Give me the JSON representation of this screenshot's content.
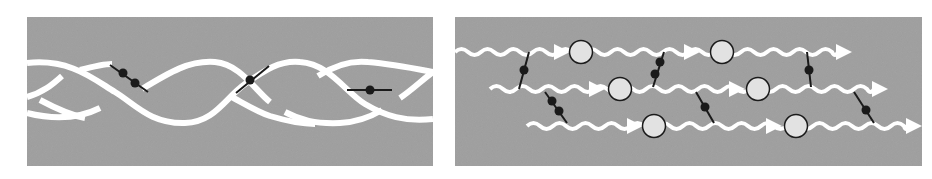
{
  "figure": {
    "panels": [
      {
        "id": "left",
        "description": "double-helix strands with cross-linking molecules",
        "bounds": {
          "x": 27,
          "y": 17,
          "w": 406,
          "h": 149
        },
        "linkers": [
          {
            "x1": 110,
            "y1": 65,
            "x2": 148,
            "y2": 92,
            "dots": [
              [
                123,
                73
              ],
              [
                135,
                83
              ]
            ]
          },
          {
            "x1": 236,
            "y1": 93,
            "x2": 269,
            "y2": 66,
            "dots": [
              [
                250,
                80
              ]
            ]
          },
          {
            "x1": 347,
            "y1": 90,
            "x2": 392,
            "y2": 90,
            "dots": [
              [
                370,
                90
              ]
            ]
          }
        ]
      },
      {
        "id": "right",
        "description": "parallel wavy strands with arrows, circles, and cross-linking molecules",
        "bounds": {
          "x": 455,
          "y": 17,
          "w": 467,
          "h": 149
        },
        "rows": [
          {
            "y": 52,
            "x_start": 455,
            "x_end": 852,
            "arrows": [
              570,
              700,
              852
            ],
            "circles": [
              581,
              722
            ]
          },
          {
            "y": 89,
            "x_start": 490,
            "x_end": 888,
            "arrows": [
              605,
              745,
              888
            ],
            "circles": [
              620,
              758
            ]
          },
          {
            "y": 126,
            "x_start": 527,
            "x_end": 922,
            "arrows": [
              643,
              782,
              922
            ],
            "circles": [
              654,
              796
            ]
          }
        ],
        "linkers": [
          {
            "x1": 529,
            "y1": 52,
            "x2": 519,
            "y2": 89,
            "dots": [
              [
                524,
                70
              ]
            ]
          },
          {
            "x1": 545,
            "y1": 92,
            "x2": 567,
            "y2": 123,
            "dots": [
              [
                552,
                101
              ],
              [
                559,
                111
              ]
            ]
          },
          {
            "x1": 664,
            "y1": 52,
            "x2": 653,
            "y2": 87,
            "dots": [
              [
                660,
                62
              ],
              [
                655,
                74
              ]
            ]
          },
          {
            "x1": 696,
            "y1": 92,
            "x2": 714,
            "y2": 123,
            "dots": [
              [
                705,
                107
              ]
            ]
          },
          {
            "x1": 807,
            "y1": 52,
            "x2": 811,
            "y2": 87,
            "dots": [
              [
                809,
                70
              ]
            ]
          },
          {
            "x1": 854,
            "y1": 92,
            "x2": 874,
            "y2": 123,
            "dots": [
              [
                866,
                110
              ]
            ]
          }
        ]
      }
    ],
    "colors": {
      "panel_bg": "#a3a3a3",
      "strand": "#ffffff",
      "linker": "#1a1a1a",
      "circle_fill": "#e2e2e2",
      "circle_stroke": "#1a1a1a"
    }
  }
}
